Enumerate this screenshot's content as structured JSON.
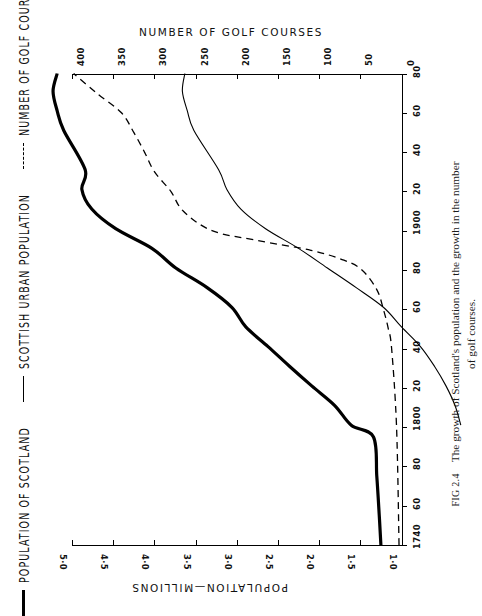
{
  "figure": {
    "number": "FIG 2.4",
    "caption_line1": "The growth of Scotland's population and the growth in the number",
    "caption_line2": "of golf courses."
  },
  "legend": {
    "items": [
      {
        "label": "POPULATION OF SCOTLAND",
        "style": "thick-solid",
        "swatch": "line-thick-icon"
      },
      {
        "label": "SCOTTISH URBAN POPULATION",
        "style": "thin-solid",
        "swatch": "line-thin-icon"
      },
      {
        "label": "NUMBER OF GOLF COURSES",
        "style": "dashed",
        "swatch": "line-dashed-icon"
      }
    ]
  },
  "axes": {
    "top": {
      "title": "NUMBER OF GOLF COURSES",
      "ticks": [
        "0",
        "50",
        "100",
        "150",
        "200",
        "250",
        "300",
        "350",
        "400"
      ]
    },
    "bottom": {
      "title": "POPULATION—MILLIONS",
      "ticks": [
        "1·0",
        "1·5",
        "2·0",
        "2·5",
        "3·0",
        "3·5",
        "4·0",
        "4·5",
        "5·0"
      ]
    },
    "right": {
      "title": "",
      "ticks": [
        "1740",
        "60",
        "80",
        "1800",
        "20",
        "40",
        "60",
        "80",
        "1900",
        "20",
        "40",
        "60",
        "80"
      ]
    }
  },
  "chart_data": {
    "type": "line",
    "title": "The growth of Scotland's population and the growth in the number of golf courses.",
    "orientation": "rotated-90",
    "xlabel": "YEAR",
    "ylabel_top": "NUMBER OF GOLF COURSES",
    "ylabel_bottom": "POPULATION—MILLIONS",
    "xlim": [
      1740,
      1980
    ],
    "grid": false,
    "legend_position": "left-margin",
    "axis_top": {
      "label": "NUMBER OF GOLF COURSES",
      "lim": [
        0,
        400
      ],
      "ticks": [
        0,
        50,
        100,
        150,
        200,
        250,
        300,
        350,
        400
      ],
      "direction": "right-to-left"
    },
    "axis_bottom": {
      "label": "POPULATION—MILLIONS",
      "lim": [
        1.0,
        5.0
      ],
      "ticks": [
        1.0,
        1.5,
        2.0,
        2.5,
        3.0,
        3.5,
        4.0,
        4.5,
        5.0
      ],
      "direction": "right-to-left"
    },
    "axis_year": {
      "lim": [
        1740,
        1980
      ],
      "ticks": [
        1740,
        1760,
        1780,
        1800,
        1820,
        1840,
        1860,
        1880,
        1900,
        1920,
        1940,
        1960,
        1980
      ],
      "tick_labels": [
        "1740",
        "60",
        "80",
        "1800",
        "20",
        "40",
        "60",
        "80",
        "1900",
        "20",
        "40",
        "60",
        "80"
      ]
    },
    "series": [
      {
        "name": "POPULATION OF SCOTLAND",
        "style": "thick-solid",
        "units": "millions",
        "uses_axis": "bottom",
        "x": [
          1740,
          1755,
          1775,
          1795,
          1801,
          1811,
          1821,
          1831,
          1841,
          1851,
          1861,
          1871,
          1881,
          1891,
          1901,
          1911,
          1921,
          1931,
          1951,
          1961,
          1971,
          1980
        ],
        "values": [
          1.25,
          1.27,
          1.3,
          1.34,
          1.61,
          1.81,
          2.09,
          2.36,
          2.62,
          2.89,
          3.06,
          3.36,
          3.74,
          4.03,
          4.47,
          4.76,
          4.88,
          4.84,
          5.1,
          5.18,
          5.23,
          5.18
        ]
      },
      {
        "name": "SCOTTISH URBAN POPULATION",
        "style": "thin-solid",
        "units": "millions",
        "uses_axis": "bottom",
        "x": [
          1801,
          1811,
          1821,
          1831,
          1841,
          1851,
          1861,
          1871,
          1881,
          1891,
          1901,
          1911,
          1921,
          1931,
          1951,
          1961,
          1971,
          1980
        ],
        "values": [
          0.28,
          0.35,
          0.46,
          0.6,
          0.77,
          1.0,
          1.22,
          1.55,
          1.9,
          2.25,
          2.65,
          2.95,
          3.12,
          3.22,
          3.52,
          3.6,
          3.66,
          3.63
        ]
      },
      {
        "name": "NUMBER OF GOLF COURSES",
        "style": "dashed",
        "units": "courses",
        "uses_axis": "top",
        "x": [
          1740,
          1800,
          1840,
          1850,
          1860,
          1870,
          1880,
          1885,
          1890,
          1895,
          1900,
          1910,
          1920,
          1930,
          1940,
          1950,
          1960,
          1970,
          1980
        ],
        "values": [
          3,
          6,
          12,
          16,
          22,
          30,
          48,
          70,
          110,
          175,
          230,
          265,
          280,
          300,
          312,
          325,
          340,
          370,
          398
        ]
      }
    ]
  }
}
